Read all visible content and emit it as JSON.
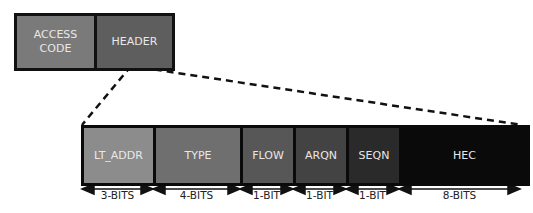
{
  "top_packet": {
    "fields": [
      {
        "label": "ACCESS\nCODE",
        "line1": "ACCESS",
        "line2": "CODE",
        "color": "#7a7a7a"
      },
      {
        "label": "HEADER",
        "color": "#5e5e5e"
      }
    ]
  },
  "header_detail": {
    "fields": [
      {
        "label": "LT_ADDR",
        "bits": "3-BITS",
        "color": "#8c8c8c"
      },
      {
        "label": "TYPE",
        "bits": "4-BITS",
        "color": "#6f6f6f"
      },
      {
        "label": "FLOW",
        "bits": "1-BIT",
        "color": "#575757"
      },
      {
        "label": "ARQN",
        "bits": "1-BIT",
        "color": "#434343"
      },
      {
        "label": "SEQN",
        "bits": "1-BIT",
        "color": "#2a2a2a"
      },
      {
        "label": "HEC",
        "bits": "8-BITS",
        "color": "#0a0a0a"
      }
    ]
  }
}
